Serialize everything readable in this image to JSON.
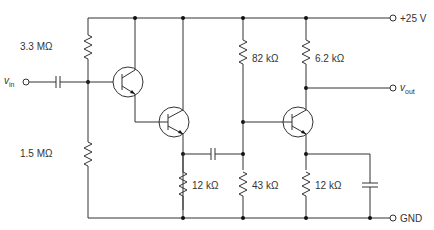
{
  "diagram": {
    "type": "circuit-schematic",
    "terminals": {
      "supply": "+25 V",
      "ground": "GND",
      "input": "v",
      "input_sub": "in",
      "output": "v",
      "output_sub": "out"
    },
    "resistors": [
      {
        "id": "R1",
        "value": "3.3 MΩ"
      },
      {
        "id": "R2",
        "value": "1.5 MΩ"
      },
      {
        "id": "R3",
        "value": "12 kΩ"
      },
      {
        "id": "R4",
        "value": "82 kΩ"
      },
      {
        "id": "R5",
        "value": "43 kΩ"
      },
      {
        "id": "R6",
        "value": "6.2 kΩ"
      },
      {
        "id": "R7",
        "value": "12 kΩ"
      }
    ],
    "transistors": [
      "Q1",
      "Q2",
      "Q3"
    ],
    "capacitors": [
      "C_in",
      "C_couple",
      "C_bypass"
    ]
  }
}
